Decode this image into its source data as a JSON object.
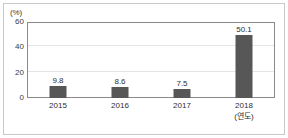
{
  "chart_data": {
    "type": "bar",
    "title": "",
    "subtitle": "",
    "xlabel": "(연도)",
    "ylabel": "(%)",
    "categories": [
      "2015",
      "2016",
      "2017",
      "2018"
    ],
    "values": [
      9.8,
      8.6,
      7.5,
      50.1
    ],
    "value_labels": [
      "9.8",
      "8.6",
      "7.5",
      "50.1"
    ],
    "ylim": [
      0,
      60
    ],
    "yticks": [
      60,
      40,
      20,
      0
    ],
    "ytick_labels": [
      "60",
      "40",
      "20",
      "0"
    ],
    "grid": "horizontal",
    "legend": "none",
    "bar_color": "#575757",
    "axis_color": "#8a8a8a",
    "grid_color": "#e4e4e4",
    "text_color": "#2e2e2e",
    "background": "#ffffff",
    "border_color": "#c8c8c8"
  },
  "axes": {
    "unit_label": "(%)",
    "x_axis_note": "(연도)"
  }
}
